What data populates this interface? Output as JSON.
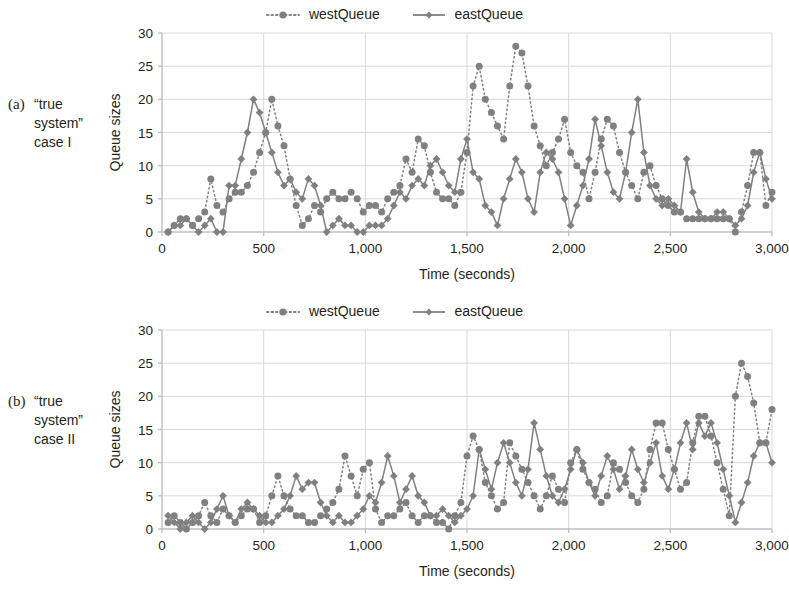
{
  "figure": {
    "panels": [
      {
        "id": "a",
        "caption_label": "(a)",
        "caption_text": "“true system” case I"
      },
      {
        "id": "b",
        "caption_label": "(b)",
        "caption_text": "“true system” case II"
      }
    ],
    "colors": {
      "series": "#808080",
      "grid": "#d9d9d9",
      "axis": "#bfbfbf",
      "text": "#231f20"
    }
  },
  "chart_data": [
    {
      "type": "line",
      "panel": "a",
      "title": "",
      "xlabel": "Time (seconds)",
      "ylabel": "Queue sizes",
      "xlim": [
        0,
        3000
      ],
      "ylim": [
        0,
        30
      ],
      "xticks": [
        0,
        500,
        1000,
        1500,
        2000,
        2500,
        3000
      ],
      "xticklabels": [
        "0",
        "500",
        "1,000",
        "1,500",
        "2,000",
        "2,500",
        "3,000"
      ],
      "yticks": [
        0,
        5,
        10,
        15,
        20,
        25,
        30
      ],
      "yticklabels": [
        "0",
        "5",
        "10",
        "15",
        "20",
        "25",
        "30"
      ],
      "grid": true,
      "legend_position": "top-center",
      "x": [
        30,
        60,
        90,
        120,
        150,
        180,
        210,
        240,
        270,
        300,
        330,
        360,
        390,
        420,
        450,
        480,
        510,
        540,
        570,
        600,
        630,
        660,
        690,
        720,
        750,
        780,
        810,
        840,
        870,
        900,
        930,
        960,
        990,
        1020,
        1050,
        1080,
        1110,
        1140,
        1170,
        1200,
        1230,
        1260,
        1290,
        1320,
        1350,
        1380,
        1410,
        1440,
        1470,
        1500,
        1530,
        1560,
        1590,
        1620,
        1650,
        1680,
        1710,
        1740,
        1770,
        1800,
        1830,
        1860,
        1890,
        1920,
        1950,
        1980,
        2010,
        2040,
        2070,
        2100,
        2130,
        2160,
        2190,
        2220,
        2250,
        2280,
        2310,
        2340,
        2370,
        2400,
        2430,
        2460,
        2490,
        2520,
        2550,
        2580,
        2610,
        2640,
        2670,
        2700,
        2730,
        2760,
        2790,
        2820,
        2850,
        2880,
        2910,
        2940,
        2970,
        3000
      ],
      "series": [
        {
          "name": "westQueue",
          "style": "dotted",
          "marker": "circle",
          "color": "#808080",
          "values": [
            0,
            1,
            2,
            2,
            1,
            2,
            3,
            8,
            4,
            3,
            5,
            6,
            6,
            7,
            9,
            12,
            15,
            20,
            16,
            13,
            8,
            4,
            1,
            2,
            4,
            3,
            5,
            6,
            5,
            5,
            6,
            5,
            3,
            4,
            4,
            3,
            5,
            6,
            7,
            11,
            9,
            14,
            13,
            9,
            6,
            5,
            5,
            4,
            6,
            12,
            22,
            25,
            20,
            18,
            16,
            14,
            22,
            28,
            27,
            22,
            16,
            13,
            10,
            12,
            14,
            17,
            12,
            10,
            9,
            5,
            9,
            14,
            17,
            16,
            12,
            9,
            7,
            5,
            9,
            10,
            7,
            5,
            4,
            3,
            3,
            2,
            2,
            2,
            2,
            2,
            2,
            2,
            2,
            0,
            3,
            7,
            12,
            12,
            4,
            6
          ]
        },
        {
          "name": "eastQueue",
          "style": "solid",
          "marker": "diamond",
          "color": "#808080",
          "values": [
            0,
            1,
            1,
            2,
            1,
            0,
            1,
            2,
            0,
            0,
            7,
            7,
            11,
            15,
            20,
            18,
            15,
            12,
            9,
            7,
            8,
            6,
            5,
            8,
            7,
            4,
            0,
            1,
            2,
            1,
            1,
            0,
            0,
            1,
            1,
            1,
            2,
            4,
            6,
            5,
            7,
            8,
            7,
            10,
            11,
            9,
            7,
            6,
            11,
            14,
            9,
            8,
            4,
            3,
            1,
            5,
            8,
            11,
            9,
            5,
            3,
            9,
            12,
            11,
            9,
            5,
            1,
            4,
            7,
            11,
            17,
            13,
            9,
            6,
            5,
            9,
            15,
            20,
            12,
            7,
            5,
            4,
            5,
            4,
            3,
            11,
            6,
            3,
            2,
            2,
            3,
            3,
            2,
            1,
            2,
            4,
            9,
            12,
            8,
            5
          ]
        }
      ]
    },
    {
      "type": "line",
      "panel": "b",
      "title": "",
      "xlabel": "Time (seconds)",
      "ylabel": "Queue sizes",
      "xlim": [
        0,
        3000
      ],
      "ylim": [
        0,
        30
      ],
      "xticks": [
        0,
        500,
        1000,
        1500,
        2000,
        2500,
        3000
      ],
      "xticklabels": [
        "0",
        "500",
        "1,000",
        "1,500",
        "2,000",
        "2,500",
        "3,000"
      ],
      "yticks": [
        0,
        5,
        10,
        15,
        20,
        25,
        30
      ],
      "yticklabels": [
        "0",
        "5",
        "10",
        "15",
        "20",
        "25",
        "30"
      ],
      "grid": true,
      "legend_position": "top-center",
      "x": [
        30,
        60,
        90,
        120,
        150,
        180,
        210,
        240,
        270,
        300,
        330,
        360,
        390,
        420,
        450,
        480,
        510,
        540,
        570,
        600,
        630,
        660,
        690,
        720,
        750,
        780,
        810,
        840,
        870,
        900,
        930,
        960,
        990,
        1020,
        1050,
        1080,
        1110,
        1140,
        1170,
        1200,
        1230,
        1260,
        1290,
        1320,
        1350,
        1380,
        1410,
        1440,
        1470,
        1500,
        1530,
        1560,
        1590,
        1620,
        1650,
        1680,
        1710,
        1740,
        1770,
        1800,
        1830,
        1860,
        1890,
        1920,
        1950,
        1980,
        2010,
        2040,
        2070,
        2100,
        2130,
        2160,
        2190,
        2220,
        2250,
        2280,
        2310,
        2340,
        2370,
        2400,
        2430,
        2460,
        2490,
        2520,
        2550,
        2580,
        2610,
        2640,
        2670,
        2700,
        2730,
        2760,
        2790,
        2820,
        2850,
        2880,
        2910,
        2940,
        2970,
        3000
      ],
      "series": [
        {
          "name": "westQueue",
          "style": "dotted",
          "marker": "circle",
          "color": "#808080",
          "values": [
            1,
            2,
            1,
            0,
            1,
            2,
            4,
            2,
            1,
            3,
            2,
            1,
            2,
            3,
            3,
            1,
            2,
            5,
            8,
            5,
            3,
            2,
            2,
            1,
            1,
            2,
            3,
            4,
            6,
            11,
            8,
            5,
            9,
            10,
            3,
            1,
            2,
            2,
            3,
            4,
            2,
            1,
            2,
            2,
            1,
            1,
            0,
            2,
            4,
            11,
            14,
            12,
            7,
            5,
            3,
            4,
            13,
            11,
            9,
            7,
            5,
            3,
            5,
            8,
            6,
            4,
            10,
            12,
            9,
            7,
            6,
            4,
            5,
            10,
            9,
            7,
            5,
            4,
            6,
            12,
            16,
            16,
            12,
            9,
            6,
            7,
            13,
            17,
            17,
            14,
            10,
            6,
            2,
            20,
            25,
            23,
            19,
            13,
            13,
            18
          ]
        },
        {
          "name": "eastQueue",
          "style": "solid",
          "marker": "diamond",
          "color": "#808080",
          "values": [
            2,
            1,
            0,
            1,
            2,
            1,
            0,
            1,
            3,
            5,
            2,
            1,
            3,
            4,
            3,
            2,
            1,
            1,
            2,
            3,
            5,
            8,
            6,
            7,
            7,
            4,
            2,
            1,
            2,
            1,
            1,
            2,
            3,
            5,
            4,
            7,
            11,
            8,
            4,
            6,
            8,
            5,
            4,
            2,
            2,
            3,
            2,
            1,
            2,
            3,
            5,
            12,
            9,
            6,
            10,
            13,
            10,
            7,
            5,
            9,
            16,
            12,
            8,
            5,
            4,
            6,
            9,
            12,
            10,
            7,
            5,
            8,
            11,
            9,
            6,
            8,
            12,
            9,
            7,
            10,
            13,
            8,
            6,
            9,
            13,
            16,
            12,
            16,
            14,
            16,
            13,
            9,
            5,
            1,
            4,
            7,
            11,
            13,
            13,
            10
          ]
        }
      ]
    }
  ]
}
